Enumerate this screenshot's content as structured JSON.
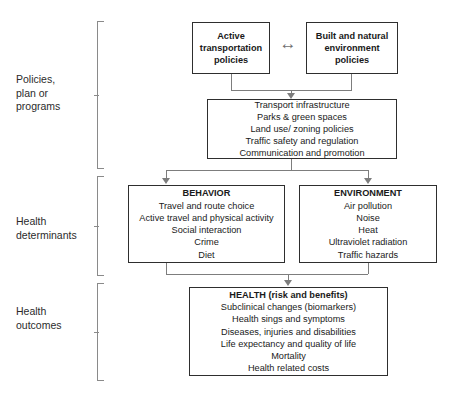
{
  "diagram": {
    "sections": [
      {
        "id": "policies",
        "label": "Policies,\nplan or\nprograms"
      },
      {
        "id": "determinants",
        "label": "Health\ndeterminants"
      },
      {
        "id": "outcomes",
        "label": "Health\noutcomes"
      }
    ],
    "boxes": {
      "active_transport": {
        "lines": [
          "Active",
          "transportation",
          "policies"
        ]
      },
      "built_natural": {
        "lines": [
          "Built and natural",
          "environment",
          "policies"
        ]
      },
      "interventions": {
        "lines": [
          "Transport infrastructure",
          "Parks & green spaces",
          "Land use/ zoning policies",
          "Traffic safety and regulation",
          "Communication and promotion"
        ]
      },
      "behavior": {
        "title": "BEHAVIOR",
        "lines": [
          "Travel and route choice",
          "Active travel and physical activity",
          "Social interaction",
          "Crime",
          "Diet"
        ]
      },
      "environment": {
        "title": "ENVIRONMENT",
        "lines": [
          "Air pollution",
          "Noise",
          "Heat",
          "Ultraviolet radiation",
          "Traffic hazards"
        ]
      },
      "health": {
        "title": "HEALTH (risk and benefits)",
        "lines": [
          "Subclinical changes (biomarkers)",
          "Health sings and symptoms",
          "Diseases, injuries and disabilities",
          "Life expectancy and quality of life",
          "Mortality",
          "Health related costs"
        ]
      }
    },
    "connectors": {
      "bidirectional_arrow_glyph": "↔"
    },
    "colors": {
      "box_border": "#2e2e2e",
      "connector": "#7d7d7d",
      "bracket": "#8a8a8a",
      "text": "#1a1a1a",
      "background": "#ffffff"
    }
  }
}
